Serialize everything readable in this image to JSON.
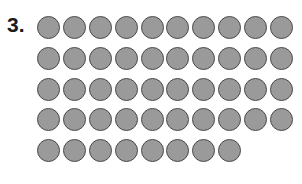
{
  "problem": {
    "number_label": "3.",
    "rows": [
      10,
      10,
      10,
      10,
      8
    ],
    "total_dots": 48,
    "colors": {
      "dot_fill": "#9a9a9a",
      "dot_border": "#4a4a4a"
    }
  }
}
